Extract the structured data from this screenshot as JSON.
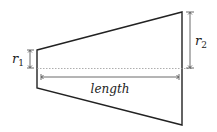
{
  "diagram": {
    "type": "truncated-cone-cross-section",
    "labels": {
      "r1": "r",
      "r1_sub": "1",
      "r2": "r",
      "r2_sub": "2",
      "length": "length"
    },
    "colors": {
      "outline": "#222222",
      "centerline": "#999999",
      "dimension": "#444444"
    }
  }
}
